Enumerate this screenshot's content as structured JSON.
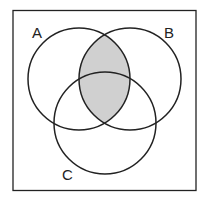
{
  "diagram": {
    "type": "venn",
    "sets": [
      {
        "label": "A"
      },
      {
        "label": "B"
      },
      {
        "label": "C"
      }
    ],
    "shaded_region": "A ∩ B",
    "colors": {
      "shade": "#d0d0d0",
      "stroke": "#222222",
      "background": "#ffffff"
    }
  }
}
